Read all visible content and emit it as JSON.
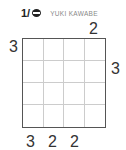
{
  "header": {
    "puzzle_number": "1/",
    "icon": "ninja-icon",
    "author": "YUKI KAWABE"
  },
  "puzzle": {
    "size": 4,
    "clues": {
      "top": [
        "",
        "",
        "",
        "2"
      ],
      "left": [
        "3",
        "",
        "",
        ""
      ],
      "right": [
        "",
        "3",
        "",
        ""
      ],
      "bottom": [
        "3",
        "2",
        "2",
        ""
      ]
    }
  }
}
